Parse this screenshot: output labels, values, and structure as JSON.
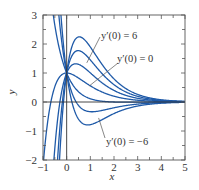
{
  "chart_data": {
    "type": "line",
    "title": "",
    "xlabel": "x",
    "ylabel": "y",
    "xlim": [
      -1,
      5
    ],
    "ylim": [
      -2,
      3
    ],
    "xticks": [
      -1,
      0,
      1,
      2,
      3,
      4,
      5
    ],
    "yticks": [
      -2,
      -1,
      0,
      1,
      2,
      3
    ],
    "grid": false,
    "legend": null,
    "series": [
      {
        "name": "y'(0) = 6",
        "slope0": 6
      },
      {
        "name": "y'(0) = 4",
        "slope0": 4
      },
      {
        "name": "y'(0) = 2",
        "slope0": 2
      },
      {
        "name": "y'(0) = 0",
        "slope0": 0
      },
      {
        "name": "y'(0) = -2",
        "slope0": -2
      },
      {
        "name": "y'(0) = -4",
        "slope0": -4
      },
      {
        "name": "y'(0) = -6",
        "slope0": -6
      }
    ],
    "annotations": [
      {
        "text": "y'(0) = 6",
        "label_xy": [
          101,
          36
        ],
        "pointer_to": [
          1.25,
          1.2
        ]
      },
      {
        "text": "y'(0) = 0",
        "label_xy": [
          117,
          60
        ],
        "pointer_to": [
          1.1,
          0.5
        ]
      },
      {
        "text": "y'(0) = -6",
        "label_xy": [
          106,
          142
        ],
        "pointer_to": [
          1.5,
          -0.6
        ]
      }
    ],
    "line_color": "#1f5aa8"
  },
  "labels": {
    "xlabel": "x",
    "ylabel": "y",
    "ann_6": "y′(0) = 6",
    "ann_0": "y′(0) = 0",
    "ann_m6": "y′(0) = −6"
  }
}
